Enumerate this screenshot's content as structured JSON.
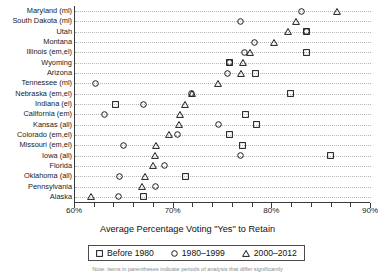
{
  "chart_data": {
    "type": "scatter",
    "title": "",
    "xlabel": "Average Percentage Voting \"Yes\" to Retain",
    "ylabel": "",
    "xlim": [
      60,
      90
    ],
    "ylim_categories": 19,
    "grid": true,
    "legend_position": "bottom",
    "xticks": [
      60,
      70,
      80,
      90
    ],
    "xticklabels": [
      "60%",
      "70%",
      "80%",
      "90%"
    ],
    "xminor_interval": 2,
    "categories": [
      "Maryland (ml)",
      "South Dakota (ml)",
      "Utah",
      "Montana",
      "Illinois (em,el)",
      "Wyoming",
      "Arizona",
      "Tennessee (ml)",
      "Nebraska (em,el)",
      "Indiana (el)",
      "California (em)",
      "Kansas (all)",
      "Colorado (em,el)",
      "Missouri (em,el)",
      "Iowa (all)",
      "Florida",
      "Oklahoma (all)",
      "Pennsylvania",
      "Alaska"
    ],
    "series": [
      {
        "name": "Before 1980",
        "marker": "square",
        "values": [
          null,
          null,
          83.5,
          null,
          83.5,
          75.7,
          78.3,
          null,
          81.8,
          64.1,
          77.3,
          78.4,
          75.7,
          77.0,
          85.9,
          null,
          71.2,
          null,
          66.9
        ]
      },
      {
        "name": "1980–1999",
        "marker": "circle",
        "values": [
          83.0,
          76.8,
          83.5,
          78.2,
          77.2,
          75.7,
          75.5,
          62.1,
          71.8,
          66.9,
          63.0,
          74.5,
          70.4,
          64.9,
          76.8,
          69.1,
          64.5,
          68.2,
          64.4
        ]
      },
      {
        "name": "2000–2012",
        "marker": "triangle",
        "values": [
          86.5,
          82.3,
          81.5,
          80.1,
          77.7,
          77.0,
          76.8,
          74.4,
          71.8,
          71.1,
          70.6,
          70.5,
          69.5,
          68.2,
          68.1,
          67.9,
          67.0,
          66.7,
          61.6
        ]
      }
    ],
    "legend": [
      {
        "label": "Before 1980",
        "marker": "square"
      },
      {
        "label": "1980–1999",
        "marker": "circle"
      },
      {
        "label": "2000–2012",
        "marker": "triangle"
      }
    ],
    "caption": "Note: items in parentheses indicate periods of analysis that differ significantly"
  },
  "colors": {
    "marker_stroke": "#1a1a1a",
    "axis": "#3a3a3a",
    "grid": "#b6b6b6",
    "background": "#ffffff"
  }
}
